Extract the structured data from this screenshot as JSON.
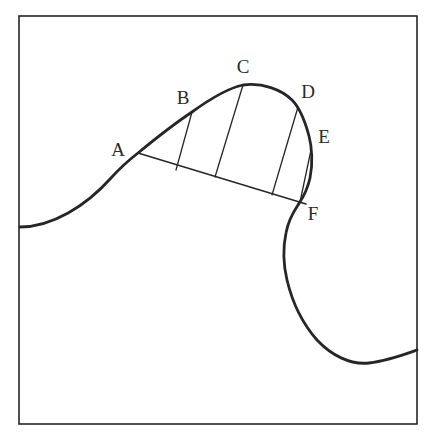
{
  "figure": {
    "background_color": "#ffffff",
    "stroke_color": "#262626",
    "label_color": "#2b2b2b",
    "frame": {
      "name": "border-rectangle",
      "x": 19,
      "y": 16,
      "width": 398,
      "height": 408,
      "stroke_width": 1.6
    },
    "labels": [
      {
        "text": "A",
        "x": 118,
        "y": 152
      },
      {
        "text": "B",
        "x": 183,
        "y": 100
      },
      {
        "text": "C",
        "x": 243,
        "y": 69
      },
      {
        "text": "D",
        "x": 308,
        "y": 94
      },
      {
        "text": "E",
        "x": 324,
        "y": 139
      },
      {
        "text": "F",
        "x": 313,
        "y": 216
      }
    ],
    "points": {
      "A": {
        "x": 138,
        "y": 153
      },
      "B": {
        "x": 192,
        "y": 112
      },
      "C": {
        "x": 243,
        "y": 85
      },
      "D": {
        "x": 298,
        "y": 107
      },
      "E": {
        "x": 311,
        "y": 150
      },
      "F": {
        "x": 306,
        "y": 204
      }
    },
    "main_curve": {
      "name": "main-curve",
      "stroke_width": 2.8,
      "path": "M 20 227 C 52 227 86 206 111 178 C 120 168 129 160 138 153 C 155 139 174 124 192 112 C 210 99 228 88 243 85 C 262 82 282 90 292 100 C 299 107 305 121 309 136 C 312 147 313 164 310 178 C 307 192 302 199 298 205 C 292 214 288 222 286 233 C 283 247 283 263 287 280 C 292 301 302 323 317 340 C 331 355 350 365 369 363 C 387 361 403 355 417 350"
    },
    "baseline": {
      "name": "baseline-chord-AF",
      "stroke_width": 1.5,
      "from": "A",
      "to": "F",
      "path": "M 138 153 L 306 204"
    },
    "chords": [
      {
        "name": "chord-B",
        "label": "B",
        "x1": 192,
        "y1": 112,
        "x2": 176,
        "y2": 170,
        "stroke_width": 1.3
      },
      {
        "name": "chord-C",
        "label": "C",
        "x1": 243,
        "y1": 85,
        "x2": 215,
        "y2": 177,
        "stroke_width": 1.3
      },
      {
        "name": "chord-D",
        "label": "D",
        "x1": 298,
        "y1": 107,
        "x2": 272,
        "y2": 195,
        "stroke_width": 1.3
      },
      {
        "name": "chord-E",
        "label": "E",
        "x1": 311,
        "y1": 150,
        "x2": 300,
        "y2": 202,
        "stroke_width": 1.3
      }
    ]
  }
}
